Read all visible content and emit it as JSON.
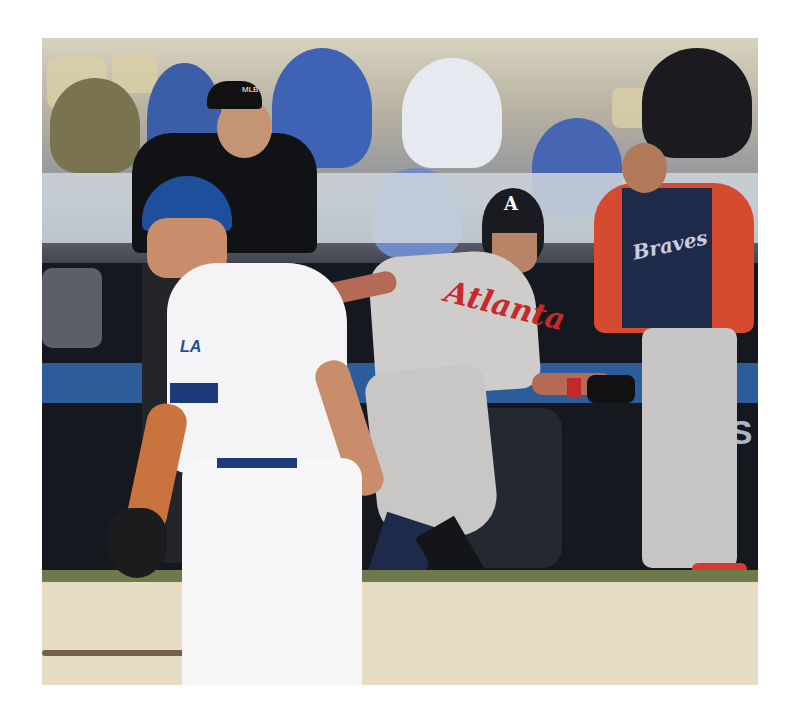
{
  "photo": {
    "description": "Baseball game: Atlanta Braves baserunner leading off first base while a Los Angeles Dodgers first baseman stands in foreground; umpire and fans in background",
    "colors": {
      "border": "#ffffff",
      "dirt": "#e7dcc4",
      "grass": "#6f7a4a",
      "braves_red": "#c62a2a",
      "braves_navy": "#1d2a4a",
      "dodgers_blue": "#1e4f9c",
      "uniform_white": "#f4f4f6",
      "road_gray": "#c9c7c6"
    },
    "visible_text": {
      "braves_jersey": "Atlanta",
      "braves_helmet_logo": "A",
      "dugout_jacket": "Braves",
      "dodgers_jersey_logo": "LA",
      "umpire_cap_logo": "MLB",
      "background_sign_1": "LC",
      "background_sign_2": "TS"
    }
  }
}
